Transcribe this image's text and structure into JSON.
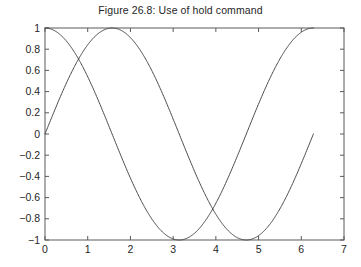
{
  "chart_data": {
    "type": "line",
    "title": "Figure 26.8: Use of hold command",
    "xlabel": "",
    "ylabel": "",
    "xlim": [
      0,
      7
    ],
    "ylim": [
      -1,
      1
    ],
    "grid": false,
    "legend": null,
    "xticks": [
      "0",
      "1",
      "2",
      "3",
      "4",
      "5",
      "6",
      "7"
    ],
    "xtick_values": [
      0,
      1,
      2,
      3,
      4,
      5,
      6,
      7
    ],
    "yticks": [
      "1",
      "0.8",
      "0.6",
      "0.4",
      "0.2",
      "0",
      "−0.2",
      "−0.4",
      "−0.6",
      "−0.8",
      "−1"
    ],
    "ytick_values": [
      1,
      0.8,
      0.6,
      0.4,
      0.2,
      0,
      -0.2,
      -0.4,
      -0.6,
      -0.8,
      -1
    ],
    "series": [
      {
        "name": "sin(x)",
        "color": "#4a4a4a",
        "x_start": 0,
        "x_end": 6.2832,
        "function": "sin",
        "amplitude": 1,
        "phase": 0
      },
      {
        "name": "cos(x)",
        "color": "#4a4a4a",
        "x_start": 0,
        "x_end": 6.2832,
        "function": "cos",
        "amplitude": 1,
        "phase": 0
      }
    ]
  },
  "axes": {
    "frame_color": "#5a5a5a",
    "background": "#ffffff"
  }
}
